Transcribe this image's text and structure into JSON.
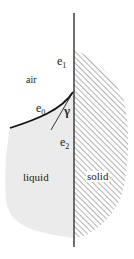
{
  "diagram": {
    "labels": {
      "air": "air",
      "liquid": "liquid",
      "solid": "solid",
      "e1": "e",
      "e1_sub": "1",
      "e0": "e",
      "e0_sub": "0",
      "e2": "e",
      "e2_sub": "2",
      "gamma": "γ"
    },
    "colors": {
      "liquid_fill": "#ebebeb",
      "line": "#222222",
      "hatch": "#555555"
    }
  }
}
